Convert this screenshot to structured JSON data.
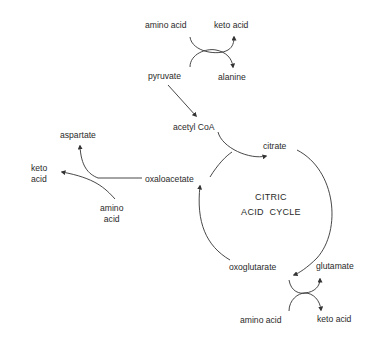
{
  "diagram": {
    "title": "CITRIC ACID CYCLE",
    "cycle_label_line1": "CITRIC",
    "cycle_label_line2": "ACID  CYCLE",
    "nodes": {
      "amino_acid_top": "amino acid",
      "keto_acid_top": "keto acid",
      "pyruvate": "pyruvate",
      "alanine": "alanine",
      "acetyl_coa": "acetyl CoA",
      "citrate": "citrate",
      "oxaloacetate": "oxaloacetate",
      "aspartate": "aspartate",
      "keto_acid_left_line1": "keto",
      "keto_acid_left_line2": "acid",
      "amino_acid_left_line1": "amino",
      "amino_acid_left_line2": "acid",
      "oxoglutarate": "oxoglutarate",
      "glutamate": "glutamate",
      "amino_acid_bottom": "amino acid",
      "keto_acid_bottom": "keto acid"
    },
    "edges": [
      {
        "from": "amino acid",
        "to": "keto acid",
        "type": "transamination",
        "coupled_with": "pyruvate -> alanine"
      },
      {
        "from": "pyruvate",
        "to": "alanine",
        "type": "transamination"
      },
      {
        "from": "pyruvate",
        "to": "acetyl CoA"
      },
      {
        "from": "acetyl CoA",
        "to": "citrate",
        "joins": "oxaloacetate"
      },
      {
        "from": "citrate",
        "to": "oxoglutarate",
        "type": "cycle"
      },
      {
        "from": "oxoglutarate",
        "to": "oxaloacetate",
        "type": "cycle"
      },
      {
        "from": "oxaloacetate",
        "to": "aspartate",
        "type": "transamination"
      },
      {
        "from": "amino acid",
        "to": "keto acid",
        "type": "transamination",
        "coupled_with": "oxaloacetate -> aspartate"
      },
      {
        "from": "oxoglutarate",
        "to": "glutamate",
        "type": "transamination"
      },
      {
        "from": "amino acid",
        "to": "keto acid",
        "type": "transamination",
        "coupled_with": "oxoglutarate -> glutamate"
      }
    ],
    "colors": {
      "line": "#333333",
      "text": "#2a2a2a",
      "background": "#ffffff"
    }
  }
}
